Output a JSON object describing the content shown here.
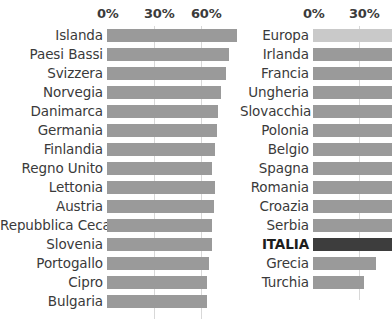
{
  "chart_data": {
    "type": "bar",
    "title": "",
    "xlabel": "",
    "ylabel": "",
    "orientation": "horizontal",
    "grid": true,
    "legend": null,
    "panels": [
      {
        "name": "left-panel",
        "xlim": [
          0,
          75
        ],
        "ticks": [
          {
            "label": "0%",
            "value": 0
          },
          {
            "label": "30%",
            "value": 30
          },
          {
            "label": "60%",
            "value": 60
          }
        ],
        "categories": [
          "Islanda",
          "Paesi Bassi",
          "Svizzera",
          "Norvegia",
          "Danimarca",
          "Germania",
          "Finlandia",
          "Regno Unito",
          "Lettonia",
          "Austria",
          "Repubblica Ceca",
          "Slovenia",
          "Portogallo",
          "Cipro",
          "Bulgaria"
        ],
        "values": [
          83,
          78,
          76,
          73,
          71,
          70,
          69,
          67,
          69,
          68,
          67,
          67,
          65,
          64,
          64
        ],
        "styles": [
          "normal",
          "normal",
          "normal",
          "normal",
          "normal",
          "normal",
          "normal",
          "normal",
          "normal",
          "normal",
          "normal",
          "normal",
          "normal",
          "normal",
          "normal"
        ]
      },
      {
        "name": "right-panel",
        "xlim": [
          0,
          52
        ],
        "ticks": [
          {
            "label": "0%",
            "value": 0
          },
          {
            "label": "30%",
            "value": 30
          }
        ],
        "categories": [
          "Europa",
          "Irlanda",
          "Francia",
          "Ungheria",
          "Slovacchia",
          "Polonia",
          "Belgio",
          "Spagna",
          "Romania",
          "Croazia",
          "Serbia",
          "ITALIA",
          "Grecia",
          "Turchia"
        ],
        "values": [
          52,
          52,
          52,
          52,
          52,
          52,
          52,
          52,
          52,
          52,
          52,
          52,
          41,
          33
        ],
        "styles": [
          "light",
          "normal",
          "normal",
          "normal",
          "normal",
          "normal",
          "normal",
          "normal",
          "normal",
          "normal",
          "normal",
          "dark",
          "normal",
          "normal"
        ]
      }
    ]
  }
}
